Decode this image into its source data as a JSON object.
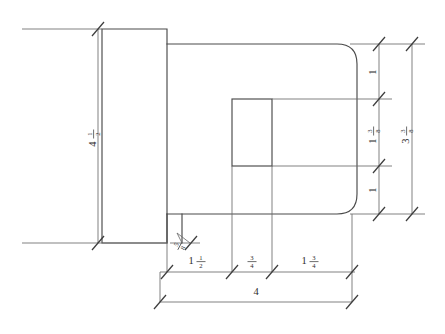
{
  "drawing": {
    "title": "Mechanical part orthographic dimension drawing",
    "background_color": "#ffffff",
    "line_color": "#4a4a4a",
    "dimension_color": "#6b6b6b",
    "text_color": "#2e2e2e",
    "units": "inches"
  },
  "dimensions": {
    "left_height": {
      "label": "4 1/2",
      "whole": "4",
      "numerator": "1",
      "denominator": "2",
      "orientation": "vertical",
      "location": "left-flange-height"
    },
    "right_upper": {
      "label": "1",
      "whole": "1",
      "numerator": "",
      "denominator": "",
      "orientation": "vertical",
      "location": "right-top-segment"
    },
    "right_middle": {
      "label": "1 3/8",
      "whole": "1",
      "numerator": "3",
      "denominator": "8",
      "orientation": "vertical",
      "location": "right-middle-segment"
    },
    "right_lower": {
      "label": "1",
      "whole": "1",
      "numerator": "",
      "denominator": "",
      "orientation": "vertical",
      "location": "right-bottom-segment"
    },
    "right_overall": {
      "label": "3 3/8",
      "whole": "3",
      "numerator": "3",
      "denominator": "8",
      "orientation": "vertical",
      "location": "right-overall-height"
    },
    "bottom_first": {
      "label": "1 1/2",
      "whole": "1",
      "numerator": "1",
      "denominator": "2",
      "orientation": "horizontal",
      "location": "bottom-chain-segment-1"
    },
    "bottom_second": {
      "label": "3/4",
      "whole": "",
      "numerator": "3",
      "denominator": "4",
      "orientation": "horizontal",
      "location": "bottom-chain-segment-2"
    },
    "bottom_third": {
      "label": "1 3/4",
      "whole": "1",
      "numerator": "3",
      "denominator": "4",
      "orientation": "horizontal",
      "location": "bottom-chain-segment-3"
    },
    "bottom_overall": {
      "label": "4",
      "whole": "4",
      "numerator": "",
      "denominator": "",
      "orientation": "horizontal",
      "location": "bottom-overall-length"
    },
    "notch": {
      "label": "5/8",
      "whole": "",
      "numerator": "5",
      "denominator": "8",
      "orientation": "diagonal",
      "location": "notch-leader-callout"
    }
  }
}
